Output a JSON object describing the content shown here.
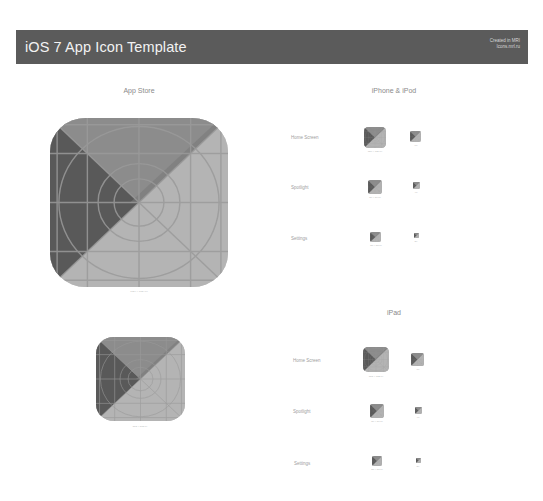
{
  "header": {
    "title": "iOS 7 App Icon Template",
    "credit_line1": "Created in MRI",
    "credit_line2": "Icons.mrl.ru"
  },
  "colors": {
    "header_bg": "#5b5b5b",
    "icon_dark": "#595959",
    "icon_mid": "#8c8c8c",
    "icon_light": "#b4b4b4",
    "grid_line": "#9a9a9a"
  },
  "app_store": {
    "title": "App Store",
    "icons": [
      {
        "caption": "1024 × 1024 px"
      },
      {
        "caption": "512 × 512 px"
      }
    ]
  },
  "iphone": {
    "title": "iPhone & iPod",
    "rows": [
      {
        "label": "Home Screen",
        "retina_caption": "120 × 120 px",
        "standard_caption": "60"
      },
      {
        "label": "Spotlight",
        "retina_caption": "80 × 80 px",
        "standard_caption": "40"
      },
      {
        "label": "Settings",
        "retina_caption": "58 × 58 px",
        "standard_caption": "29"
      }
    ]
  },
  "ipad": {
    "title": "iPad",
    "rows": [
      {
        "label": "Home Screen",
        "retina_caption": "152 × 152 px",
        "standard_caption": "76"
      },
      {
        "label": "Spotlight",
        "retina_caption": "80 × 80 px",
        "standard_caption": "40"
      },
      {
        "label": "Settings",
        "retina_caption": "58 × 58 px",
        "standard_caption": "29"
      }
    ]
  }
}
